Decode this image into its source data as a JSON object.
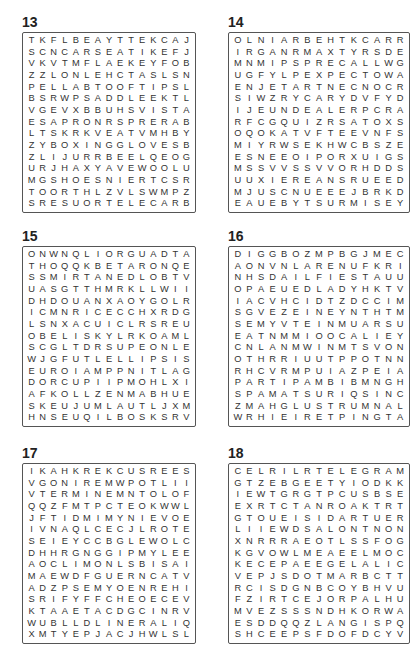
{
  "puzzles": [
    {
      "number": "13",
      "rows": [
        "TKFLBEAYTTEKCAJ",
        "SCNCARSEATIKEFJ",
        "VKVTMFLAEKEYFOB",
        "ZZLONLEHCTASLSN",
        "PELLABTOOFTIPSL",
        "BSRWPSADDLEEKTL",
        "VGEVXBBUHSVISTA",
        "ESAPRONRSPRERAB",
        "LTSKRKVEATVMHBY",
        "ZYBOXINGGLOVESB",
        "ZLIJURRBEELQEOG",
        "URJHAXYAVEWOOLU",
        "MGSHOESNIERTCSR",
        "TOORTHLZVLSWMPZ",
        "SRESUORTELECARB"
      ]
    },
    {
      "number": "14",
      "rows": [
        "OLNIARBEHTKCARR",
        "IRGANRMAXTYRSDE",
        "MNMIPSPRECALLWG",
        "UGFYLPEXPECTOWA",
        "ENJETARTNECNOCR",
        "SIWZRYCARYDVFYD",
        "IJEUNDEALERPCRA",
        "RFCGQUIZRSATOXS",
        "OQOKATVFTEEVNFS",
        "MIYRWSEKHWCBSZE",
        "ESNEEOIPORXUIGS",
        "MSSVVSSVVORHDDS",
        "UUXIEREANSRUEED",
        "MJUSCNUEEEJBRKD",
        "EAUEBYTSURMISEY"
      ]
    },
    {
      "number": "15",
      "rows": [
        "ONWNQLIORGUADTA",
        "THOQQKBETARONQE",
        "SSMIRTANEDLOBTV",
        "UASGTTHMRKLLWII",
        "DHDOUANXAOYGOLR",
        "ICMNRICECCHXRDG",
        "LSNXACUICLRSREU",
        "OBELISKYLRKOAML",
        "SCGLTDRSUPEONLE",
        "WJGFUTLELLIPSIS",
        "EUROIAMPPNITLAG",
        "DORCUPIIPMOHLXI",
        "AFKOLLZENMABHUE",
        "SKEUJUMLAUTLJXM",
        "HNSEUQILBOSKSRV"
      ]
    },
    {
      "number": "16",
      "rows": [
        "DIGGBOZMPBGJMEC",
        "AONVNLARENUFKRI",
        "NHSDAILFIESTAUU",
        "OPAEUEDLADYHKTV",
        "IACVHCIDTZDCCIM",
        "SGVEZEINEYNTHTM",
        "SEMYVTEINMUARSU",
        "EATNMMIOOCALIEY",
        "CNLANMWINMTSVON",
        "OTHRRIUUTPPOTNN",
        "RHCVRMPUIAZPEIA",
        "PARTIPAMBIBMNGH",
        "SPAMATSURIQSINC",
        "ZMAHGLUSTRUMNAL",
        "WRHIEIRETPINGTA"
      ]
    },
    {
      "number": "17",
      "rows": [
        "IKAHKREKCUSREES",
        "VGONIREMWPOTLII",
        "VTERMINEMNTOLOF",
        "QQZFMTPCTEOKWWL",
        "JFTIDMIMYNIEVOE",
        "IVNAQLCECJLROTE",
        "SEIEYCCBGLEWOLC",
        "DHHRGNGGIPMYLEE",
        "AOCLIMONLSBISAI",
        "MAEWDFGUERNCATV",
        "ADZPSEMYOENREHI",
        "SRIFYFFCHEOECEV",
        "KTAAETACDGCINRV",
        "WUBLLDLINERALIQ",
        "XMTYEPJACJHWLSL"
      ]
    },
    {
      "number": "18",
      "rows": [
        "CELRILRTELEGRAM",
        "GTZEBGEETYIODKK",
        "IEWTGRGTPCUSBSE",
        "EXRTCTANROAKTRT",
        "GTOUEISIDARTUER",
        "LIIEWDSALONTNON",
        "XNRRRAEOTLSSFOG",
        "KGVOWLMEAEELMOC",
        "KECEPAEEGELALIC",
        "VEPJSDOTMARBCTT",
        "RCISDGNBCOYBHVU",
        "FZIRTCEJORPALHU",
        "MVEZSSSNDHKORWA",
        "ESDDQQZLANGISPQ",
        "SHCEEPSFDOFDCYV"
      ]
    }
  ],
  "found_words": {
    "13": [
      "BRACELET",
      "RUSSES",
      "APRON",
      "BOXINGGLOVES",
      "SHOES",
      "CARSEAT",
      "TEKCAJ",
      "FOB",
      "SADDLE",
      "FLAKE",
      "FOOTBALL"
    ],
    "14": [
      "CARTHEBRAIN",
      "RECALL",
      "EXPECT",
      "CONCERN",
      "DEALER",
      "SURMISE"
    ],
    "15": [
      "UMLAUT",
      "ELLIPSIS",
      "EURO",
      "OBELISK",
      "SEQUILBO",
      "RANTON"
    ],
    "16": [
      "FUNERAL",
      "FIESTA",
      "LUSTRUM",
      "TSURIMA",
      "RETPIN"
    ],
    "17": [
      "SUCKER",
      "ONIREM",
      "ERMINE",
      "ELLIPSE"
    ],
    "18": [
      "TELEGRAM",
      "LANGIS",
      "SPEECH",
      "PROJECT",
      "SALON",
      "DIRECT"
    ]
  }
}
